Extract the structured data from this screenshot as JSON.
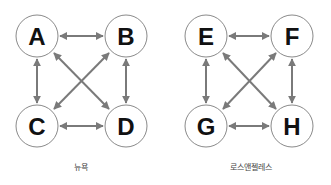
{
  "colors": {
    "edge": "#7a7a7a",
    "node_stroke": "#8a8a8a",
    "node_fill": "#ffffff",
    "label": "#111111",
    "caption": "#444444"
  },
  "graphs": [
    {
      "caption": "뉴욕",
      "nodes": [
        {
          "id": "A",
          "label": "A"
        },
        {
          "id": "B",
          "label": "B"
        },
        {
          "id": "C",
          "label": "C"
        },
        {
          "id": "D",
          "label": "D"
        }
      ],
      "edges": [
        [
          "A",
          "B"
        ],
        [
          "A",
          "C"
        ],
        [
          "B",
          "D"
        ],
        [
          "C",
          "D"
        ],
        [
          "A",
          "D"
        ],
        [
          "B",
          "C"
        ]
      ],
      "edge_type": "bidirectional"
    },
    {
      "caption": "로스앤젤레스",
      "nodes": [
        {
          "id": "E",
          "label": "E"
        },
        {
          "id": "F",
          "label": "F"
        },
        {
          "id": "G",
          "label": "G"
        },
        {
          "id": "H",
          "label": "H"
        }
      ],
      "edges": [
        [
          "E",
          "F"
        ],
        [
          "E",
          "G"
        ],
        [
          "F",
          "H"
        ],
        [
          "G",
          "H"
        ],
        [
          "E",
          "H"
        ],
        [
          "F",
          "G"
        ]
      ],
      "edge_type": "bidirectional"
    }
  ]
}
